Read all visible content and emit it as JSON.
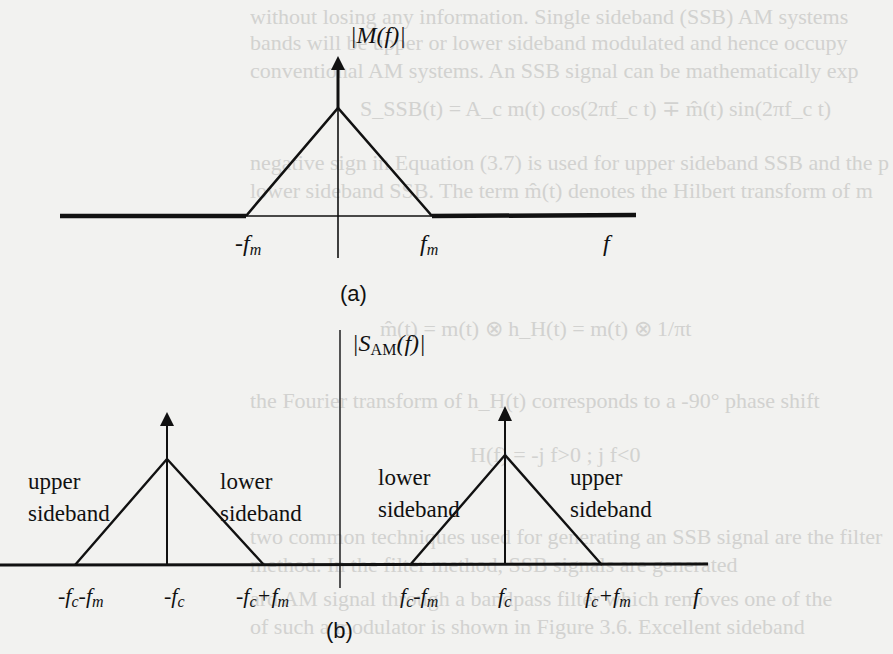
{
  "background_text": [
    "without losing any information. Single sideband (SSB) AM systems",
    "bands will be upper or lower sideband modulated and hence occupy",
    "conventional AM systems. An SSB signal can be mathematically exp",
    "S_SSB(t) = A_c m(t) cos(2πf_c t) ∓ m̂(t) sin(2πf_c t)",
    "negative sign in Equation (3.7) is used for upper sideband SSB and the p",
    "lower sideband SSB. The term m̂(t) denotes the Hilbert transform of m",
    "m̂(t) = m(t) ⊗ h_H(t) = m(t) ⊗ 1/πt",
    "the Fourier transform of h_H(t) corresponds to a -90° phase shift",
    "H(f) = -j f>0 ; j f<0",
    "two common techniques used for generating an SSB signal are the filter",
    "method. In the filter method, SSB signals are generated",
    "ard AM signal through a bandpass filter which removes one of the",
    "of such a modulator is shown in Figure 3.6. Excellent sideband"
  ],
  "figure_a": {
    "y_label": "|M(f)|",
    "x_label": "f",
    "ticks": [
      "-f_m",
      "f_m"
    ],
    "caption": "(a)"
  },
  "figure_b": {
    "y_label_main": "|S",
    "y_label_sub": "AM",
    "y_label_tail": "(f)|",
    "x_label": "f",
    "left_band": {
      "upper_label": "upper\nsideband",
      "lower_label": "lower\nsideband"
    },
    "right_band": {
      "lower_label": "lower\nsideband",
      "upper_label": "upper\nsideband"
    },
    "ticks": [
      "-f_c-f_m",
      "-f_c",
      "-f_c+f_m",
      "f_c-f_m",
      "f_c",
      "f_c+f_m"
    ],
    "caption": "(b)"
  },
  "colors": {
    "background": "#f2f2f0",
    "ink": "#111111"
  }
}
